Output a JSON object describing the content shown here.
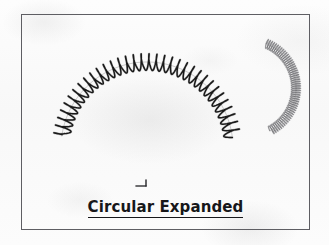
{
  "figure": {
    "caption": "Circular Expanded",
    "caption_underlined": true,
    "frame": {
      "x": 21,
      "y": 14,
      "width": 289,
      "height": 216,
      "border_color": "#5e5e63"
    },
    "background_color": "#fbfbfb",
    "ink_color": "#1a1a1a",
    "faint_ink_color": "#6e6e72"
  },
  "objects": [
    {
      "id": "main-spring",
      "name": "circular-expanded-spring",
      "description": "Large helical compression spring bent along a circular arc, coils widely spaced (expanded pitch)",
      "state": "expanded",
      "arc_center_x": 147,
      "arc_center_y": 148,
      "arc_radius": 86,
      "start_angle_deg": 188,
      "end_angle_deg": 352,
      "coil_count": 34,
      "coil_amplitude": 8,
      "stroke_color": "#1a1a1a",
      "stroke_width": 1.5
    },
    {
      "id": "secondary-spring",
      "name": "circular-compressed-spring",
      "description": "Smaller tightly wound circular spring arc shown at upper right, coils closely spaced",
      "state": "compressed",
      "arc_center_x": 248,
      "arc_center_y": 88,
      "arc_radius": 48,
      "start_angle_deg": -68,
      "end_angle_deg": 62,
      "coil_count": 52,
      "coil_amplitude": 4.5,
      "stroke_color": "#6e6e72",
      "stroke_width": 0.9
    },
    {
      "id": "scale-mark",
      "name": "dimension-tick-mark",
      "description": "Small L-shaped scale/pointer tick mark below the arc center",
      "x": 136,
      "y": 180
    }
  ]
}
